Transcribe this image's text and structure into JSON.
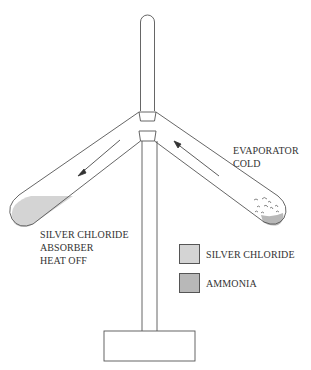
{
  "diagram": {
    "title": "",
    "colors": {
      "line": "#555555",
      "silver_chloride": "#d4d4d4",
      "ammonia": "#b8b8b8",
      "background": "#ffffff"
    },
    "labels": {
      "evaporator": [
        "EVAPORATOR",
        "COLD"
      ],
      "absorber": [
        "SILVER CHLORIDE",
        "ABSORBER",
        "HEAT OFF"
      ]
    },
    "legend": [
      {
        "label": "SILVER CHLORIDE",
        "color": "#d4d4d4"
      },
      {
        "label": "AMMONIA",
        "color": "#b8b8b8"
      }
    ],
    "flow_arrows": [
      {
        "arm": "left",
        "direction": "down-left"
      },
      {
        "arm": "right",
        "direction": "up-left"
      }
    ]
  }
}
